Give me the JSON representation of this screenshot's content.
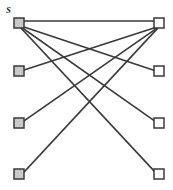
{
  "figure": {
    "width": 173,
    "height": 190,
    "background": "#ffffff",
    "kind": "bipartite-graph-diagram"
  },
  "labels": {
    "source": "S",
    "source_position": {
      "x": 6,
      "y": 6
    }
  },
  "style": {
    "edge_color": "#3a3a3a",
    "edge_width": 1.6,
    "node_size": 10,
    "node_stroke": "#3a3a3a",
    "node_stroke_width": 1.5,
    "filled_fill": "#c9c9c9",
    "hollow_fill": "#ffffff"
  },
  "nodes": {
    "left": [
      {
        "id": "L1",
        "name": "left-node-1",
        "cx": 19,
        "cy": 23,
        "fill": "filled",
        "label": "S"
      },
      {
        "id": "L2",
        "name": "left-node-2",
        "cx": 19,
        "cy": 71,
        "fill": "filled",
        "label": ""
      },
      {
        "id": "L3",
        "name": "left-node-3",
        "cx": 19,
        "cy": 123,
        "fill": "filled",
        "label": ""
      },
      {
        "id": "L4",
        "name": "left-node-4",
        "cx": 19,
        "cy": 174,
        "fill": "filled",
        "label": ""
      }
    ],
    "right": [
      {
        "id": "R1",
        "name": "right-node-1",
        "cx": 159,
        "cy": 23,
        "fill": "hollow",
        "label": ""
      },
      {
        "id": "R2",
        "name": "right-node-2",
        "cx": 159,
        "cy": 71,
        "fill": "hollow",
        "label": ""
      },
      {
        "id": "R3",
        "name": "right-node-3",
        "cx": 159,
        "cy": 123,
        "fill": "hollow",
        "label": ""
      },
      {
        "id": "R4",
        "name": "right-node-4",
        "cx": 159,
        "cy": 174,
        "fill": "hollow",
        "label": ""
      }
    ]
  },
  "edges": [
    {
      "id": "E1",
      "name": "edge-L1-R1",
      "from": "L1",
      "to": "R1",
      "x1": 19,
      "y1": 21,
      "x2": 159,
      "y2": 21
    },
    {
      "id": "E2",
      "name": "edge-L1-R2",
      "from": "L1",
      "to": "R2",
      "x1": 21,
      "y1": 26,
      "x2": 156,
      "y2": 71
    },
    {
      "id": "E3",
      "name": "edge-L1-R3",
      "from": "L1",
      "to": "R3",
      "x1": 21,
      "y1": 27,
      "x2": 156,
      "y2": 122
    },
    {
      "id": "E4",
      "name": "edge-L1-R4",
      "from": "L1",
      "to": "R4",
      "x1": 21,
      "y1": 28,
      "x2": 156,
      "y2": 173
    },
    {
      "id": "E5",
      "name": "edge-L2-R1",
      "from": "L2",
      "to": "R1",
      "x1": 24,
      "y1": 70,
      "x2": 157,
      "y2": 27
    },
    {
      "id": "E6",
      "name": "edge-L3-R1",
      "from": "L3",
      "to": "R1",
      "x1": 24,
      "y1": 121,
      "x2": 157,
      "y2": 28
    },
    {
      "id": "E7",
      "name": "edge-L4-R1",
      "from": "L4",
      "to": "R1",
      "x1": 24,
      "y1": 172,
      "x2": 157,
      "y2": 29
    }
  ]
}
